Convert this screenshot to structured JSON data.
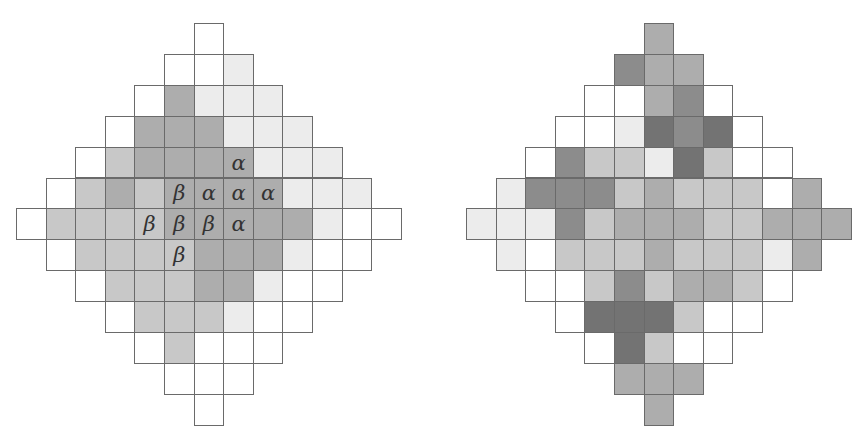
{
  "shades": [
    "#ffffff",
    "#ececec",
    "#c8c8c8",
    "#adadad",
    "#8c8c8c",
    "#737373"
  ],
  "left_grid": {
    "origin": [
      16,
      23
    ],
    "cell_w": 29.6,
    "cell_h": 30.9,
    "rows": [
      {
        "start": 6,
        "shades": [
          0
        ]
      },
      {
        "start": 5,
        "shades": [
          0,
          0,
          1
        ]
      },
      {
        "start": 4,
        "shades": [
          0,
          3,
          1,
          1,
          1
        ]
      },
      {
        "start": 3,
        "shades": [
          0,
          3,
          3,
          3,
          1,
          1,
          1
        ]
      },
      {
        "start": 2,
        "shades": [
          0,
          2,
          3,
          3,
          3,
          3,
          1,
          1,
          1
        ]
      },
      {
        "start": 1,
        "shades": [
          0,
          2,
          3,
          2,
          3,
          3,
          3,
          3,
          1,
          1,
          1
        ]
      },
      {
        "start": 0,
        "shades": [
          0,
          2,
          2,
          2,
          2,
          3,
          3,
          3,
          3,
          3,
          1,
          0,
          0
        ]
      },
      {
        "start": 1,
        "shades": [
          0,
          2,
          2,
          2,
          2,
          3,
          3,
          3,
          1,
          0,
          0
        ]
      },
      {
        "start": 2,
        "shades": [
          0,
          2,
          2,
          2,
          3,
          3,
          1,
          0,
          0
        ]
      },
      {
        "start": 3,
        "shades": [
          0,
          2,
          2,
          2,
          1,
          0,
          0
        ]
      },
      {
        "start": 4,
        "shades": [
          0,
          2,
          0,
          0,
          0
        ]
      },
      {
        "start": 5,
        "shades": [
          0,
          0,
          0
        ]
      },
      {
        "start": 6,
        "shades": [
          0
        ]
      }
    ],
    "labels": [
      {
        "row": 4,
        "col": 7,
        "text": "α"
      },
      {
        "row": 5,
        "col": 5,
        "text": "β"
      },
      {
        "row": 5,
        "col": 6,
        "text": "α"
      },
      {
        "row": 5,
        "col": 7,
        "text": "α"
      },
      {
        "row": 5,
        "col": 8,
        "text": "α"
      },
      {
        "row": 6,
        "col": 4,
        "text": "β"
      },
      {
        "row": 6,
        "col": 5,
        "text": "β"
      },
      {
        "row": 6,
        "col": 6,
        "text": "β"
      },
      {
        "row": 6,
        "col": 7,
        "text": "α"
      },
      {
        "row": 7,
        "col": 5,
        "text": "β"
      }
    ]
  },
  "right_grid": {
    "origin": [
      466,
      23
    ],
    "cell_w": 29.6,
    "cell_h": 30.9,
    "rows": [
      {
        "start": 6,
        "shades": [
          3
        ]
      },
      {
        "start": 5,
        "shades": [
          4,
          3,
          3
        ]
      },
      {
        "start": 4,
        "shades": [
          0,
          0,
          3,
          4,
          0
        ]
      },
      {
        "start": 3,
        "shades": [
          0,
          0,
          1,
          5,
          4,
          5,
          0
        ]
      },
      {
        "start": 2,
        "shades": [
          0,
          4,
          2,
          2,
          1,
          5,
          2,
          0,
          0
        ]
      },
      {
        "start": 1,
        "shades": [
          1,
          4,
          4,
          4,
          2,
          3,
          2,
          2,
          2,
          0,
          3
        ]
      },
      {
        "start": 0,
        "shades": [
          1,
          1,
          1,
          4,
          2,
          3,
          3,
          3,
          2,
          2,
          3,
          3,
          3
        ]
      },
      {
        "start": 1,
        "shades": [
          1,
          0,
          2,
          2,
          2,
          3,
          2,
          2,
          2,
          1,
          3
        ]
      },
      {
        "start": 2,
        "shades": [
          0,
          0,
          2,
          4,
          2,
          3,
          3,
          2,
          0
        ]
      },
      {
        "start": 3,
        "shades": [
          0,
          5,
          5,
          5,
          2,
          0,
          0
        ]
      },
      {
        "start": 4,
        "shades": [
          0,
          5,
          2,
          0,
          0
        ]
      },
      {
        "start": 5,
        "shades": [
          3,
          3,
          3
        ]
      },
      {
        "start": 6,
        "shades": [
          3
        ]
      }
    ],
    "labels": []
  }
}
